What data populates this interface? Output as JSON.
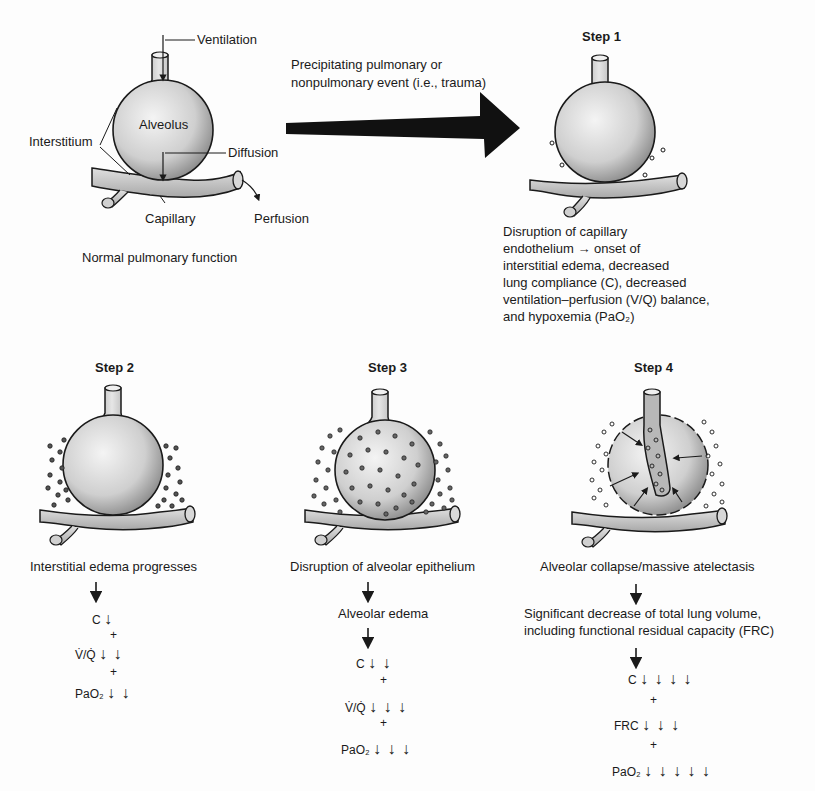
{
  "normal": {
    "labels": {
      "ventilation": "Ventilation",
      "alveolus": "Alveolus",
      "interstitium": "Interstitium",
      "diffusion": "Diffusion",
      "capillary": "Capillary",
      "perfusion": "Perfusion"
    },
    "caption": "Normal pulmonary function"
  },
  "event": {
    "line1": "Precipitating pulmonary or",
    "line2": "nonpulmonary event (i.e., trauma)"
  },
  "steps": [
    {
      "title": "Step 1",
      "description": [
        "Disruption of capillary",
        "endothelium → onset of",
        "interstitial edema, decreased",
        "lung compliance (C), decreased",
        "ventilation–perfusion (V/Q) balance,",
        "and hypoxemia (PaO₂)"
      ]
    },
    {
      "title": "Step 2",
      "flow": [
        "Interstitial edema progresses"
      ],
      "effects": [
        {
          "label": "C",
          "arrows": 1
        },
        {
          "label": "V̇/Q̇",
          "arrows": 2
        },
        {
          "label": "PaO₂",
          "arrows": 2
        }
      ]
    },
    {
      "title": "Step 3",
      "flow": [
        "Disruption of alveolar epithelium",
        "Alveolar edema"
      ],
      "effects": [
        {
          "label": "C",
          "arrows": 2
        },
        {
          "label": "V̇/Q̇",
          "arrows": 3
        },
        {
          "label": "PaO₂",
          "arrows": 3
        }
      ]
    },
    {
      "title": "Step 4",
      "flow": [
        "Alveolar collapse/massive atelectasis",
        "Significant decrease of total lung volume,",
        "including functional residual capacity (FRC)"
      ],
      "effects": [
        {
          "label": "C",
          "arrows": 4
        },
        {
          "label": "FRC",
          "arrows": 3
        },
        {
          "label": "PaO₂",
          "arrows": 5
        }
      ]
    }
  ],
  "symbols": {
    "plus": "+",
    "down_arrow": "↓"
  },
  "colors": {
    "ink": "#1a1a1a",
    "sphere_light": "#efefef",
    "sphere_dark": "#9a9a9a",
    "background": "#fdfdfd"
  }
}
